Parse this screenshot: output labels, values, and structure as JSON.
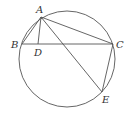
{
  "diagram": {
    "type": "geometry",
    "colors": {
      "stroke": "#555555",
      "label": "#333333",
      "background": "#ffffff"
    },
    "circle": {
      "cx": 67,
      "cy": 59,
      "r": 48
    },
    "points": {
      "A": {
        "label": "A",
        "x": 41,
        "y": 17,
        "lx": 36,
        "ly": 13
      },
      "B": {
        "label": "B",
        "x": 22,
        "y": 44,
        "lx": 11,
        "ly": 48
      },
      "C": {
        "label": "C",
        "x": 113,
        "y": 44,
        "lx": 116,
        "ly": 48
      },
      "D": {
        "label": "D",
        "x": 38,
        "y": 44,
        "lx": 34,
        "ly": 56
      },
      "E": {
        "label": "E",
        "x": 102,
        "y": 92,
        "lx": 102,
        "ly": 103
      }
    },
    "segments": [
      {
        "id": "AB",
        "from": "A",
        "to": "B"
      },
      {
        "id": "AC",
        "from": "A",
        "to": "C"
      },
      {
        "id": "BC",
        "from": "B",
        "to": "C"
      },
      {
        "id": "AD",
        "from": "A",
        "to": "D"
      },
      {
        "id": "AE",
        "from": "A",
        "to": "E"
      },
      {
        "id": "CE",
        "from": "C",
        "to": "E"
      }
    ]
  }
}
